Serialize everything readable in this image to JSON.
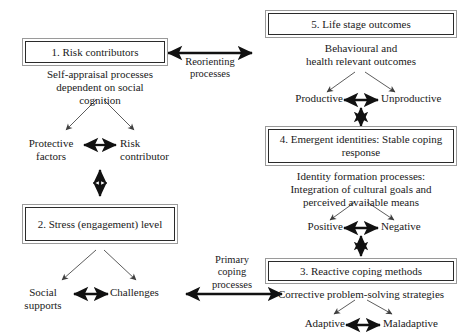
{
  "diagram": {
    "colors": {
      "background": "#ffffff",
      "text": "#1a1a1a",
      "box_outer_border": "#9a9a9a",
      "box_inner_border": "#2b2b2b",
      "thick_arrow": "#111111",
      "thin_arrow": "#4a4a4a"
    },
    "boxes": [
      {
        "id": "box1",
        "label": "1. Risk contributors"
      },
      {
        "id": "box2",
        "label": "2. Stress\n(engagement) level"
      },
      {
        "id": "box3",
        "label": "3. Reactive coping methods"
      },
      {
        "id": "box4",
        "label": "4. Emergent identities:\nStable coping response"
      },
      {
        "id": "box5",
        "label": "5. Life stage outcomes"
      }
    ],
    "captions": [
      {
        "id": "cap1",
        "text": "Self-appraisal processes\ndependent on social\ncognition"
      },
      {
        "id": "cap5",
        "text": "Behavioural and\nhealth relevant outcomes"
      },
      {
        "id": "cap4",
        "text": "Identity formation processes:\nIntegration of cultural goals and\nperceived available means"
      },
      {
        "id": "cap3",
        "text": "Corrective problem-solving strategies"
      }
    ],
    "leaves": [
      {
        "id": "leaf-protective",
        "text": "Protective\nfactors"
      },
      {
        "id": "leaf-risk",
        "text": "Risk\ncontributor"
      },
      {
        "id": "leaf-social",
        "text": "Social\nsupports"
      },
      {
        "id": "leaf-challenges",
        "text": "Challenges"
      },
      {
        "id": "leaf-productive",
        "text": "Productive"
      },
      {
        "id": "leaf-unproductive",
        "text": "Unproductive"
      },
      {
        "id": "leaf-positive",
        "text": "Positive"
      },
      {
        "id": "leaf-negative",
        "text": "Negative"
      },
      {
        "id": "leaf-adaptive",
        "text": "Adaptive"
      },
      {
        "id": "leaf-maladaptive",
        "text": "Maladaptive"
      }
    ],
    "edge_labels": [
      {
        "id": "edge-reorienting",
        "text": "Reorienting\nprocesses"
      },
      {
        "id": "edge-primary",
        "text": "Primary\ncoping\nprocesses"
      }
    ]
  }
}
